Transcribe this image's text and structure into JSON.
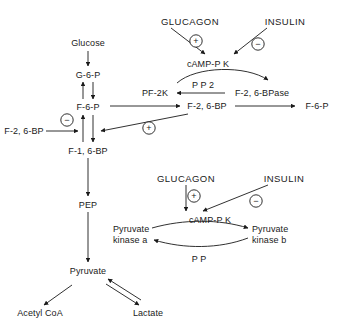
{
  "diagram": {
    "type": "biochemical-pathway",
    "colors": {
      "stroke": "#1a1a1a",
      "text": "#1a1a1a",
      "background": "#ffffff"
    },
    "glycolysis_chain": {
      "glucose": "Glucose",
      "g6p": "G-6-P",
      "f6p": "F-6-P",
      "f16bp": "F-1, 6-BP",
      "pep": "PEP",
      "pyruvate": "Pyruvate",
      "acetyl_coa": "Acetyl CoA",
      "lactate": "Lactate"
    },
    "upper_module": {
      "glucagon": "GLUCAGON",
      "insulin": "INSULIN",
      "camp_pk": "cAMP-P K",
      "plus_sign": "+",
      "minus_sign": "−",
      "pf2k": "PF-2K",
      "pp2": "P P 2",
      "f26bpase": "F-2, 6-BPase",
      "f26bp_center": "F-2, 6-BP",
      "f6p_right": "F-6-P",
      "f26bp_left": "F-2, 6-BP",
      "inhibit_sign": "−",
      "activate_sign": "+"
    },
    "lower_module": {
      "glucagon": "GLUCAGON",
      "insulin": "INSULIN",
      "camp_pk": "cAMP-P K",
      "plus_sign": "+",
      "minus_sign": "−",
      "pyruvate_kinase_a_line1": "Pyruvate",
      "pyruvate_kinase_a_line2": "kinase a",
      "pyruvate_kinase_b_line1": "Pyruvate",
      "pyruvate_kinase_b_line2": "kinase b",
      "pp": "P P"
    }
  }
}
